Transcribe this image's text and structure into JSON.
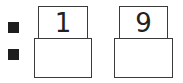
{
  "worksheet": {
    "markers": [
      "square-bullet",
      "square-bullet"
    ],
    "columns": [
      {
        "top_digit": "1",
        "bottom_value": ""
      },
      {
        "top_digit": "9",
        "bottom_value": ""
      }
    ]
  }
}
